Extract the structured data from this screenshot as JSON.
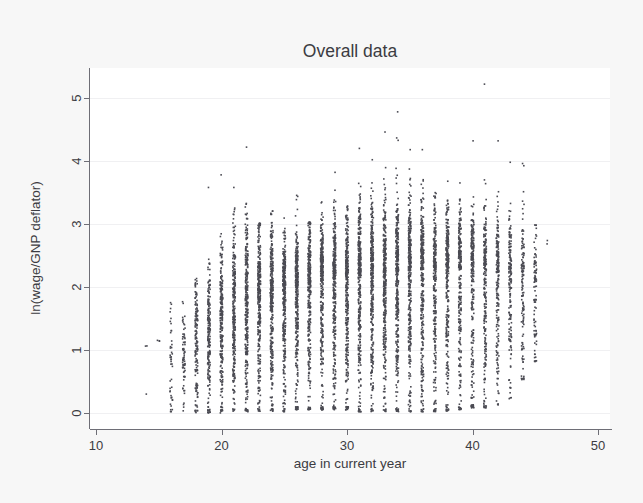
{
  "figure": {
    "title": "Overall data",
    "background_color": "#f7f7f7",
    "plot_background_color": "#ffffff",
    "point_color": "#4b4b53",
    "axis_color": "#6e6e76",
    "text_color": "#3c3c42",
    "grid_color": "#f0f0f2"
  },
  "chart_data": {
    "type": "scatter",
    "title": "Overall data",
    "xlabel": "age in current year",
    "ylabel": "ln(wage/GNP deflator)",
    "xlim": [
      10,
      50
    ],
    "ylim": [
      0,
      5.35
    ],
    "xticks": [
      10,
      20,
      30,
      40,
      50
    ],
    "xtick_labels": [
      "10",
      "20",
      "30",
      "40",
      "50"
    ],
    "yticks": [
      0,
      1,
      2,
      3,
      4,
      5
    ],
    "ytick_labels": [
      "0",
      "1",
      "2",
      "3",
      "4",
      "5"
    ],
    "grid": "horizontal-faint",
    "legend": "none",
    "marker": "dot",
    "marker_size_px": 1.6,
    "x_variable": "age",
    "y_variable": "ln(wage/GNP deflator)",
    "columns": [
      {
        "age": 14,
        "n": 2,
        "ymin": 0.3,
        "ymax": 1.08,
        "p05": 0.3,
        "p50": 1.05,
        "p95": 1.08
      },
      {
        "age": 15,
        "n": 3,
        "ymin": 1.1,
        "ymax": 1.16,
        "p05": 1.1,
        "p50": 1.13,
        "p95": 1.16
      },
      {
        "age": 16,
        "n": 44,
        "ymin": 0.02,
        "ymax": 1.8,
        "p05": 0.1,
        "p50": 0.92,
        "p95": 1.72
      },
      {
        "age": 17,
        "n": 70,
        "ymin": 0.0,
        "ymax": 2.78,
        "p05": 0.08,
        "p50": 0.95,
        "p95": 1.7
      },
      {
        "age": 18,
        "n": 150,
        "ymin": 0.0,
        "ymax": 2.7,
        "p05": 0.1,
        "p50": 1.15,
        "p95": 2.1
      },
      {
        "age": 19,
        "n": 205,
        "ymin": 0.0,
        "ymax": 3.58,
        "p05": 0.12,
        "p50": 1.3,
        "p95": 2.22
      },
      {
        "age": 20,
        "n": 250,
        "ymin": 0.0,
        "ymax": 3.78,
        "p05": 0.15,
        "p50": 1.45,
        "p95": 2.42
      },
      {
        "age": 21,
        "n": 290,
        "ymin": 0.02,
        "ymax": 3.58,
        "p05": 0.18,
        "p50": 1.6,
        "p95": 2.72
      },
      {
        "age": 22,
        "n": 310,
        "ymin": 0.02,
        "ymax": 4.22,
        "p05": 0.2,
        "p50": 1.72,
        "p95": 2.8
      },
      {
        "age": 23,
        "n": 330,
        "ymin": 0.02,
        "ymax": 3.02,
        "p05": 0.22,
        "p50": 1.82,
        "p95": 2.72
      },
      {
        "age": 24,
        "n": 350,
        "ymin": 0.02,
        "ymax": 3.22,
        "p05": 0.25,
        "p50": 1.9,
        "p95": 2.8
      },
      {
        "age": 25,
        "n": 340,
        "ymin": 0.02,
        "ymax": 3.12,
        "p05": 0.26,
        "p50": 1.95,
        "p95": 2.62
      },
      {
        "age": 26,
        "n": 330,
        "ymin": 0.05,
        "ymax": 3.46,
        "p05": 0.28,
        "p50": 2.0,
        "p95": 2.76
      },
      {
        "age": 27,
        "n": 320,
        "ymin": 0.05,
        "ymax": 3.04,
        "p05": 0.3,
        "p50": 2.05,
        "p95": 2.8
      },
      {
        "age": 28,
        "n": 330,
        "ymin": 0.05,
        "ymax": 3.62,
        "p05": 0.32,
        "p50": 2.1,
        "p95": 2.92
      },
      {
        "age": 29,
        "n": 340,
        "ymin": 0.05,
        "ymax": 3.82,
        "p05": 0.3,
        "p50": 2.12,
        "p95": 2.96
      },
      {
        "age": 30,
        "n": 330,
        "ymin": 0.05,
        "ymax": 3.3,
        "p05": 0.32,
        "p50": 2.15,
        "p95": 2.96
      },
      {
        "age": 31,
        "n": 360,
        "ymin": 0.02,
        "ymax": 4.2,
        "p05": 0.3,
        "p50": 2.18,
        "p95": 3.1
      },
      {
        "age": 32,
        "n": 350,
        "ymin": 0.02,
        "ymax": 4.02,
        "p05": 0.32,
        "p50": 2.2,
        "p95": 3.1
      },
      {
        "age": 33,
        "n": 350,
        "ymin": 0.02,
        "ymax": 4.46,
        "p05": 0.34,
        "p50": 2.22,
        "p95": 3.12
      },
      {
        "age": 34,
        "n": 360,
        "ymin": 0.02,
        "ymax": 4.78,
        "p05": 0.3,
        "p50": 2.24,
        "p95": 3.16
      },
      {
        "age": 35,
        "n": 350,
        "ymin": 0.02,
        "ymax": 4.18,
        "p05": 0.32,
        "p50": 2.26,
        "p95": 3.2
      },
      {
        "age": 36,
        "n": 330,
        "ymin": 0.02,
        "ymax": 4.18,
        "p05": 0.3,
        "p50": 2.26,
        "p95": 3.12
      },
      {
        "age": 37,
        "n": 310,
        "ymin": 0.02,
        "ymax": 3.7,
        "p05": 0.3,
        "p50": 2.28,
        "p95": 3.08
      },
      {
        "age": 38,
        "n": 300,
        "ymin": 0.02,
        "ymax": 3.7,
        "p05": 0.28,
        "p50": 2.3,
        "p95": 3.1
      },
      {
        "age": 39,
        "n": 270,
        "ymin": 0.05,
        "ymax": 3.68,
        "p05": 0.25,
        "p50": 2.28,
        "p95": 3.02
      },
      {
        "age": 40,
        "n": 250,
        "ymin": 0.08,
        "ymax": 4.32,
        "p05": 0.25,
        "p50": 2.26,
        "p95": 3.0
      },
      {
        "age": 41,
        "n": 230,
        "ymin": 0.08,
        "ymax": 5.22,
        "p05": 0.28,
        "p50": 2.24,
        "p95": 3.02
      },
      {
        "age": 42,
        "n": 200,
        "ymin": 0.1,
        "ymax": 4.32,
        "p05": 0.3,
        "p50": 2.22,
        "p95": 3.02
      },
      {
        "age": 43,
        "n": 170,
        "ymin": 0.22,
        "ymax": 3.98,
        "p05": 0.4,
        "p50": 2.2,
        "p95": 3.0
      },
      {
        "age": 44,
        "n": 130,
        "ymin": 0.52,
        "ymax": 3.96,
        "p05": 0.6,
        "p50": 2.18,
        "p95": 3.02
      },
      {
        "age": 45,
        "n": 95,
        "ymin": 0.78,
        "ymax": 3.02,
        "p05": 0.84,
        "p50": 2.0,
        "p95": 2.82
      },
      {
        "age": 46,
        "n": 2,
        "ymin": 2.58,
        "ymax": 2.94,
        "p05": 2.58,
        "p50": 2.76,
        "p95": 2.94
      }
    ],
    "outliers": [
      {
        "age": 41,
        "y": 5.22
      },
      {
        "age": 34,
        "y": 4.78
      },
      {
        "age": 33,
        "y": 4.46
      },
      {
        "age": 40,
        "y": 4.32
      },
      {
        "age": 42,
        "y": 4.32
      },
      {
        "age": 22,
        "y": 4.22
      },
      {
        "age": 31,
        "y": 4.2
      },
      {
        "age": 35,
        "y": 4.18
      },
      {
        "age": 36,
        "y": 4.18
      },
      {
        "age": 32,
        "y": 4.02
      },
      {
        "age": 43,
        "y": 3.98
      },
      {
        "age": 44,
        "y": 3.96
      },
      {
        "age": 29,
        "y": 3.82
      },
      {
        "age": 20,
        "y": 3.78
      },
      {
        "age": 19,
        "y": 3.58
      },
      {
        "age": 21,
        "y": 3.58
      },
      {
        "age": 14,
        "y": 0.3
      }
    ]
  }
}
